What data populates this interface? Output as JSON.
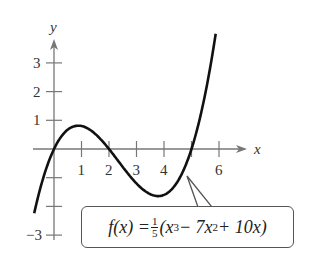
{
  "chart_data": {
    "type": "line",
    "title": "",
    "xlabel": "x",
    "ylabel": "y",
    "function": "f(x) = 1/5 (x^3 - 7x^2 + 10x)",
    "x_ticks": [
      1,
      2,
      3,
      4,
      6
    ],
    "x_tick_labels": [
      "1",
      "2",
      "3",
      "4",
      "6"
    ],
    "x_tick_marks": [
      1,
      2,
      3,
      4,
      5,
      6
    ],
    "y_ticks": [
      3,
      2,
      1,
      -3
    ],
    "y_tick_labels": [
      "3",
      "2",
      "1",
      "−3"
    ],
    "y_tick_marks": [
      3,
      2,
      1,
      -1,
      -2,
      -3
    ],
    "xlim": [
      -0.7,
      6.3
    ],
    "ylim": [
      -3.2,
      3.6
    ],
    "grid": false,
    "zeros": [
      0,
      2,
      5
    ],
    "local_max": {
      "x": 0.88,
      "y": 0.81
    },
    "local_min": {
      "x": 3.79,
      "y": -1.81
    },
    "annotation": "f(x) = 1/5(x^3 − 7x^2 + 10x)"
  },
  "labels": {
    "x_axis": "x",
    "y_axis": "y",
    "eq_fx": "f(x) = ",
    "eq_num": "1",
    "eq_den": "5",
    "eq_open": "(x",
    "eq_p1": "3",
    "eq_mid": " − 7x",
    "eq_p2": "2",
    "eq_end": " + 10x)"
  }
}
